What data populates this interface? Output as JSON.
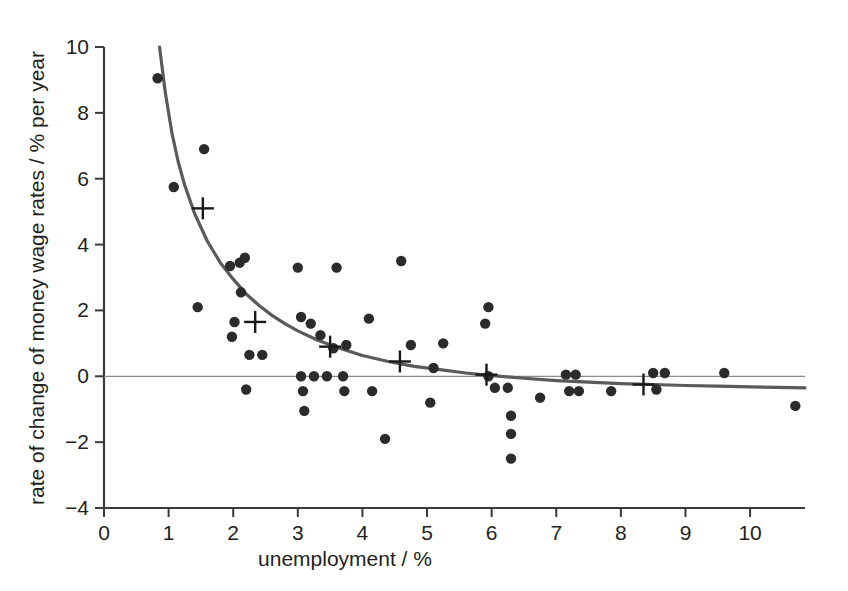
{
  "chart_data": {
    "type": "scatter",
    "title": "",
    "xlabel": "unemployment / %",
    "ylabel": "rate of change of money wage rates / % per year",
    "xlim": [
      0,
      10.85
    ],
    "ylim": [
      -4,
      10
    ],
    "xticks": [
      0,
      1,
      2,
      3,
      4,
      5,
      6,
      7,
      8,
      9,
      10
    ],
    "xtick_labels": [
      "0",
      "1",
      "2",
      "3",
      "4",
      "5",
      "6",
      "7",
      "8",
      "9",
      "10"
    ],
    "yticks": [
      -4,
      -2,
      0,
      2,
      4,
      6,
      8,
      10
    ],
    "ytick_labels": [
      "−4",
      "−2",
      "0",
      "2",
      "4",
      "6",
      "8",
      "10"
    ],
    "grid": false,
    "legend": null,
    "zero_line": {
      "y": 0,
      "color": "#8c8c8c",
      "visible": true
    },
    "series": [
      {
        "name": "observations",
        "marker": "filled-circle",
        "color": "#2b2b2b",
        "points": [
          [
            0.83,
            9.05
          ],
          [
            1.08,
            5.75
          ],
          [
            1.55,
            6.9
          ],
          [
            1.45,
            2.1
          ],
          [
            1.95,
            3.35
          ],
          [
            2.1,
            3.45
          ],
          [
            2.18,
            3.6
          ],
          [
            2.12,
            2.55
          ],
          [
            2.02,
            1.65
          ],
          [
            1.98,
            1.2
          ],
          [
            2.25,
            0.65
          ],
          [
            2.45,
            0.65
          ],
          [
            2.2,
            -0.4
          ],
          [
            3.0,
            3.3
          ],
          [
            3.05,
            1.8
          ],
          [
            3.2,
            1.6
          ],
          [
            3.35,
            1.25
          ],
          [
            3.05,
            0.0
          ],
          [
            3.25,
            0.0
          ],
          [
            3.45,
            0.0
          ],
          [
            3.7,
            0.0
          ],
          [
            3.08,
            -0.45
          ],
          [
            3.1,
            -1.05
          ],
          [
            3.72,
            -0.45
          ],
          [
            3.6,
            3.3
          ],
          [
            3.55,
            0.85
          ],
          [
            3.75,
            0.95
          ],
          [
            4.1,
            1.75
          ],
          [
            4.15,
            -0.45
          ],
          [
            4.35,
            -1.9
          ],
          [
            4.6,
            3.5
          ],
          [
            4.75,
            0.95
          ],
          [
            5.1,
            0.25
          ],
          [
            5.05,
            -0.8
          ],
          [
            5.25,
            1.0
          ],
          [
            5.95,
            2.1
          ],
          [
            5.9,
            1.6
          ],
          [
            5.95,
            0.0
          ],
          [
            6.05,
            -0.35
          ],
          [
            6.25,
            -0.35
          ],
          [
            6.3,
            -1.2
          ],
          [
            6.3,
            -1.75
          ],
          [
            6.3,
            -2.5
          ],
          [
            6.75,
            -0.65
          ],
          [
            7.15,
            0.05
          ],
          [
            7.3,
            0.05
          ],
          [
            7.2,
            -0.45
          ],
          [
            7.35,
            -0.45
          ],
          [
            7.85,
            -0.45
          ],
          [
            8.5,
            0.1
          ],
          [
            8.68,
            0.1
          ],
          [
            8.55,
            -0.4
          ],
          [
            9.6,
            0.1
          ],
          [
            10.7,
            -0.9
          ]
        ]
      },
      {
        "name": "fitted-class-means",
        "marker": "plus",
        "color": "#1a1a1a",
        "points": [
          [
            1.53,
            5.1
          ],
          [
            2.34,
            1.65
          ],
          [
            3.5,
            0.9
          ],
          [
            4.58,
            0.45
          ],
          [
            5.92,
            0.05
          ],
          [
            8.35,
            -0.25
          ]
        ]
      }
    ],
    "fitted_curve": {
      "name": "phillips-curve",
      "color": "#5a5a5a",
      "width": 3.2,
      "points": [
        [
          0.86,
          10.0
        ],
        [
          0.95,
          8.6
        ],
        [
          1.05,
          7.4
        ],
        [
          1.15,
          6.5
        ],
        [
          1.25,
          5.8
        ],
        [
          1.4,
          4.95
        ],
        [
          1.6,
          4.1
        ],
        [
          1.8,
          3.45
        ],
        [
          2.0,
          2.95
        ],
        [
          2.2,
          2.5
        ],
        [
          2.4,
          2.15
        ],
        [
          2.6,
          1.85
        ],
        [
          2.8,
          1.6
        ],
        [
          3.0,
          1.38
        ],
        [
          3.3,
          1.1
        ],
        [
          3.6,
          0.88
        ],
        [
          4.0,
          0.63
        ],
        [
          4.4,
          0.45
        ],
        [
          4.8,
          0.3
        ],
        [
          5.2,
          0.2
        ],
        [
          5.6,
          0.1
        ],
        [
          6.0,
          0.02
        ],
        [
          6.5,
          -0.06
        ],
        [
          7.0,
          -0.13
        ],
        [
          7.5,
          -0.18
        ],
        [
          8.0,
          -0.22
        ],
        [
          8.5,
          -0.25
        ],
        [
          9.0,
          -0.28
        ],
        [
          9.5,
          -0.3
        ],
        [
          10.0,
          -0.32
        ],
        [
          10.85,
          -0.35
        ]
      ]
    }
  },
  "axes": {
    "x_axis_label": "unemployment / %",
    "y_axis_label": "rate of change of money wage rates / % per year"
  }
}
